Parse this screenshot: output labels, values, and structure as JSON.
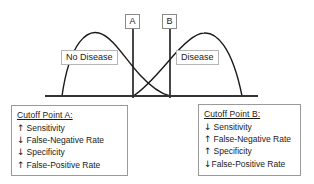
{
  "chart_data": {
    "type": "line",
    "title": "",
    "xlabel": "",
    "ylabel": "",
    "grid": false,
    "legend_position": "inline-labels",
    "annotations": [
      {
        "name": "cutoff-a",
        "label": "A",
        "x": 133
      },
      {
        "name": "cutoff-b",
        "label": "B",
        "x": 170
      }
    ],
    "series": [
      {
        "name": "No Disease",
        "label": "No Disease",
        "color": "#1a1a1a",
        "x_start": 62,
        "x_peak": 99,
        "x_end": 170,
        "peak_height": 63
      },
      {
        "name": "Disease",
        "label": "Disease",
        "color": "#1a1a1a",
        "x_start": 133,
        "x_peak": 204,
        "x_end": 242,
        "peak_height": 63
      }
    ],
    "baseline": {
      "x_start": 45,
      "x_end": 258,
      "y": 96
    }
  },
  "chart": {
    "cutoff_a_label": "A",
    "cutoff_b_label": "B",
    "region_no_disease": "No Disease",
    "region_disease": "Disease"
  },
  "annotations": {
    "cutoff_a": {
      "title": "Cutoff Point A:",
      "items": [
        {
          "arrow": "↑",
          "text": "Sensitivity",
          "tight": false
        },
        {
          "arrow": "↓",
          "text": "False-Negative Rate",
          "tight": false
        },
        {
          "arrow": "↓",
          "text": "Specificity",
          "tight": false
        },
        {
          "arrow": "↑",
          "text": "False-Positive Rate",
          "tight": false
        }
      ]
    },
    "cutoff_b": {
      "title": "Cutoff Point B:",
      "items": [
        {
          "arrow": "↓",
          "text": "Sensitivity",
          "tight": false
        },
        {
          "arrow": "↑",
          "text": "False-Negative Rate",
          "tight": false
        },
        {
          "arrow": "↑",
          "text": "Specificity",
          "tight": false
        },
        {
          "arrow": "↓",
          "text": "False-Positive Rate",
          "tight": true
        }
      ]
    }
  },
  "colors": {
    "curve": "#1a1a1a",
    "baseline": "#333333",
    "box_border": "#9a9a9a",
    "marker_border": "#8a8a8a",
    "region_border": "#b5b5b5",
    "background": "#ffffff"
  }
}
